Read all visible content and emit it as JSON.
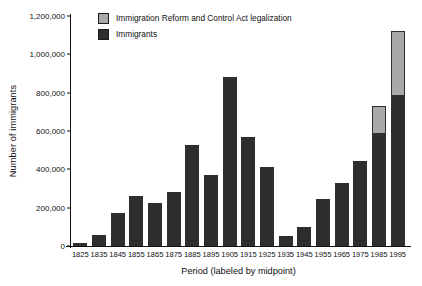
{
  "chart_data": {
    "type": "bar",
    "stacked": true,
    "title": "",
    "xlabel": "Period (labeled by midpoint)",
    "ylabel": "Number of immigrants",
    "categories": [
      "1825",
      "1835",
      "1845",
      "1855",
      "1865",
      "1875",
      "1885",
      "1895",
      "1905",
      "1915",
      "1925",
      "1935",
      "1945",
      "1955",
      "1965",
      "1975",
      "1985",
      "1995"
    ],
    "series": [
      {
        "name": "Immigrants",
        "color": "#2e2e2e",
        "values": [
          15000,
          60000,
          172000,
          260000,
          226000,
          280000,
          525000,
          370000,
          880000,
          570000,
          412000,
          50000,
          100000,
          245000,
          327000,
          442000,
          590000,
          790000
        ]
      },
      {
        "name": "Immigration Reform and Control Act legalization",
        "color": "#a9a9a9",
        "values": [
          0,
          0,
          0,
          0,
          0,
          0,
          0,
          0,
          0,
          0,
          0,
          0,
          0,
          0,
          0,
          0,
          143000,
          330000
        ]
      }
    ],
    "ylim": [
      0,
      1200000
    ],
    "yticks": [
      0,
      200000,
      400000,
      600000,
      800000,
      1000000,
      1200000
    ],
    "ytick_labels": [
      "0",
      "200,000",
      "400,000",
      "600,000",
      "800,000",
      "1,000,000",
      "1,200,000"
    ],
    "grid": false,
    "legend_position": "top-left-inside"
  },
  "legend": {
    "items": [
      {
        "label": "Immigration Reform and Control Act legalization",
        "color": "#a9a9a9"
      },
      {
        "label": "Immigrants",
        "color": "#2e2e2e"
      }
    ]
  }
}
